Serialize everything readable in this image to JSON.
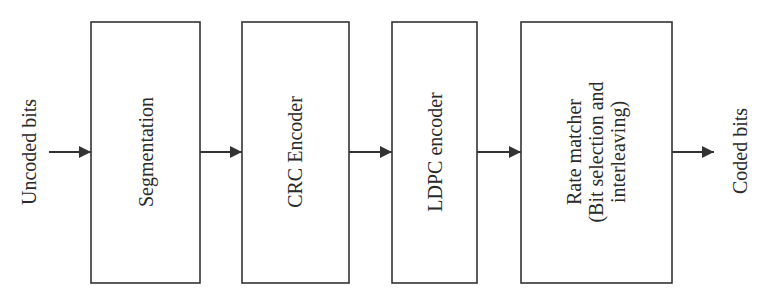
{
  "diagram": {
    "type": "block-diagram",
    "orientation": "left-to-right",
    "colors": {
      "stroke": "#333333",
      "text": "#2a2a2a",
      "background": "#ffffff"
    },
    "input": {
      "label": "Uncoded bits"
    },
    "output": {
      "label": "Coded bits"
    },
    "blocks": [
      {
        "id": "segmentation",
        "lines": [
          "Segmentation"
        ]
      },
      {
        "id": "crc-encoder",
        "lines": [
          "CRC Encoder"
        ]
      },
      {
        "id": "ldpc-encoder",
        "lines": [
          "LDPC encoder"
        ]
      },
      {
        "id": "rate-matcher",
        "lines": [
          "Rate matcher",
          "(Bit selection and",
          "interleaving)"
        ]
      }
    ],
    "edges": [
      {
        "from": "input",
        "to": "segmentation"
      },
      {
        "from": "segmentation",
        "to": "crc-encoder"
      },
      {
        "from": "crc-encoder",
        "to": "ldpc-encoder"
      },
      {
        "from": "ldpc-encoder",
        "to": "rate-matcher"
      },
      {
        "from": "rate-matcher",
        "to": "output"
      }
    ]
  }
}
